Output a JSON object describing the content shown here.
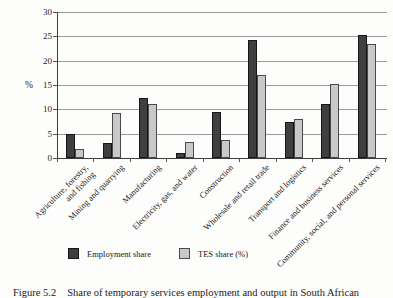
{
  "figure_caption": {
    "label": "Figure 5.2",
    "text": "Share of temporary services employment and output in South African"
  },
  "chart_data": {
    "type": "bar",
    "title": "",
    "xlabel": "",
    "ylabel": "%",
    "ylim": [
      0,
      30
    ],
    "ytick_step": 5,
    "grid": true,
    "legend_position": "bottom",
    "categories": [
      "Agriculture, forestry,\nand fishing",
      "Mining and quarrying",
      "Manufacturing",
      "Electricity, gas, and water",
      "Construction",
      "Wholesale and retail trade",
      "Transport and logistics",
      "Finance and business services",
      "Community, social, and personal services"
    ],
    "series": [
      {
        "name": "Employment share",
        "color": "#3f3f3f",
        "border_color": "#161616",
        "values": [
          4.9,
          3.1,
          12.3,
          1.1,
          9.4,
          24.2,
          7.3,
          11.1,
          25.3
        ]
      },
      {
        "name": "TES share (%)",
        "color": "#c9c9c9",
        "border_color": "#4a4a4a",
        "values": [
          1.8,
          9.3,
          11.0,
          3.3,
          3.6,
          17.1,
          8.1,
          15.2,
          23.5
        ]
      }
    ],
    "gridline_color": "#9a9a9a",
    "axis_color": "#3c3c3c"
  }
}
